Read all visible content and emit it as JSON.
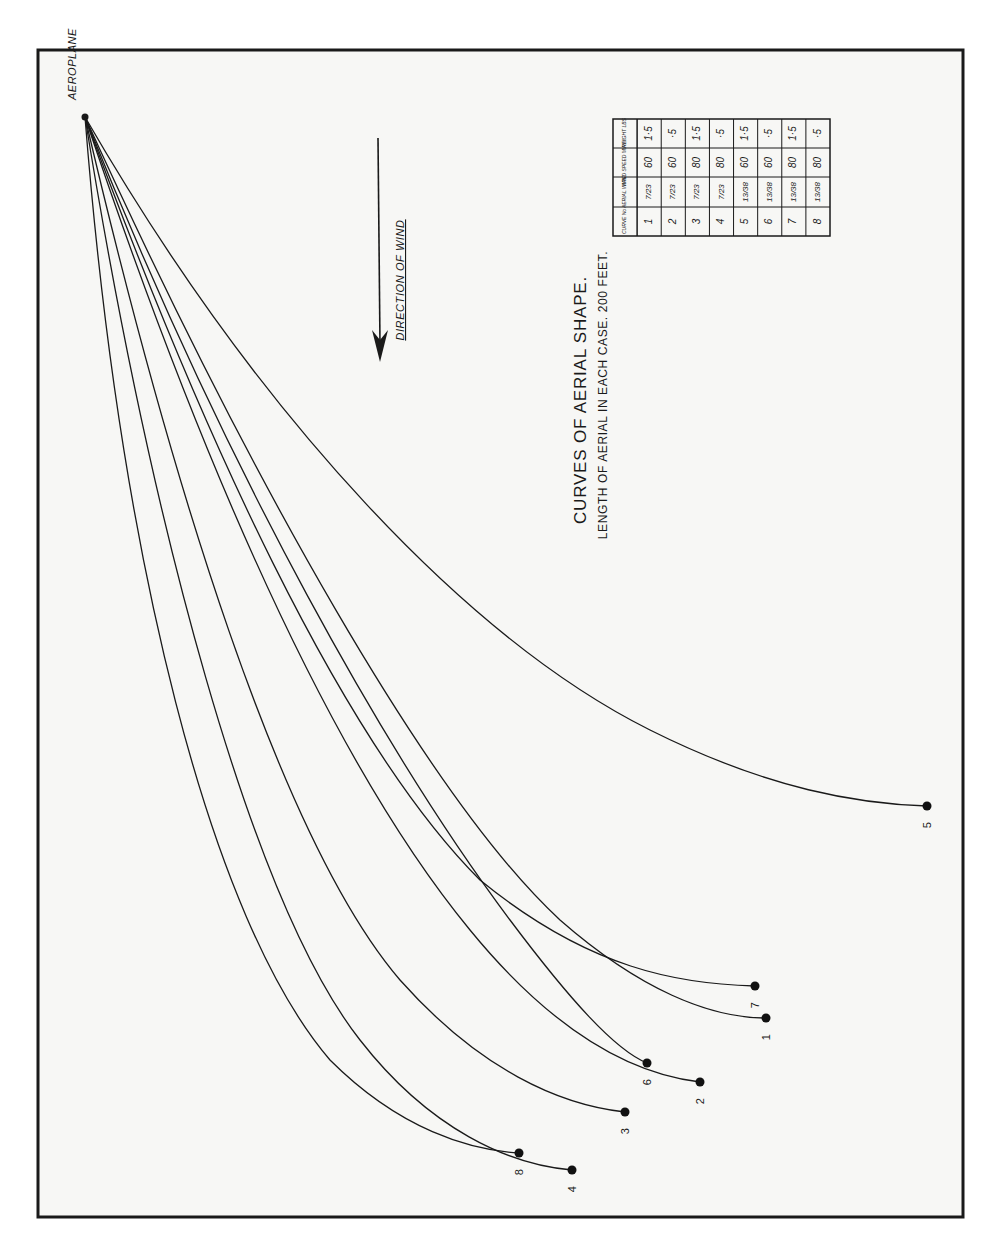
{
  "diagram": {
    "title": "CURVES OF AERIAL SHAPE.",
    "subtitle": "LENGTH OF AERIAL IN EACH CASE. 200 FEET.",
    "origin_label": "AEROPLANE",
    "wind_label": "DIRECTION OF WIND",
    "colors": {
      "ink": "#1a1a1a",
      "paper": "#f7f7f5",
      "border": "#1a1a1a"
    }
  },
  "table": {
    "headers": [
      "CURVE No",
      "AERIAL WIRE",
      "WIND SPEED M.P.H.",
      "WEIGHT LBS"
    ],
    "rows": [
      {
        "curve": "1",
        "wire": "7/23",
        "speed": "60",
        "weight": "1·5"
      },
      {
        "curve": "2",
        "wire": "7/23",
        "speed": "60",
        "weight": "·5"
      },
      {
        "curve": "3",
        "wire": "7/23",
        "speed": "80",
        "weight": "1·5"
      },
      {
        "curve": "4",
        "wire": "7/23",
        "speed": "80",
        "weight": "·5"
      },
      {
        "curve": "5",
        "wire": "13/38",
        "speed": "60",
        "weight": "1·5"
      },
      {
        "curve": "6",
        "wire": "13/38",
        "speed": "60",
        "weight": "·5"
      },
      {
        "curve": "7",
        "wire": "13/38",
        "speed": "80",
        "weight": "1·5"
      },
      {
        "curve": "8",
        "wire": "13/38",
        "speed": "80",
        "weight": "·5"
      }
    ]
  },
  "curves": [
    {
      "label": "1",
      "end": [
        766,
        1018
      ],
      "path": "M85,117 C250,480 430,800 560,920 C640,990 710,1018 766,1018"
    },
    {
      "label": "2",
      "end": [
        700,
        1082
      ],
      "path": "M85,117 C200,460 330,760 470,930 C560,1040 640,1075 700,1082"
    },
    {
      "label": "3",
      "end": [
        625,
        1112
      ],
      "path": "M85,117 C170,480 280,840 400,980 C480,1070 560,1105 625,1112"
    },
    {
      "label": "4",
      "end": [
        572,
        1170
      ],
      "path": "M85,117 C150,520 250,900 360,1040 C430,1130 510,1165 572,1170"
    },
    {
      "label": "5",
      "end": [
        927,
        806
      ],
      "path": "M85,117 C260,420 470,640 650,730 C770,790 860,804 927,806"
    },
    {
      "label": "6",
      "end": [
        647,
        1063
      ],
      "path": "M85,117 C230,480 390,760 510,920 C570,1000 615,1050 647,1063"
    },
    {
      "label": "7",
      "end": [
        755,
        986
      ],
      "path": "M85,117 C200,430 340,740 480,880 C590,970 680,984 755,986"
    },
    {
      "label": "8",
      "end": [
        519,
        1153
      ],
      "path": "M85,117 C120,560 210,920 330,1060 C400,1130 470,1150 519,1153"
    }
  ]
}
